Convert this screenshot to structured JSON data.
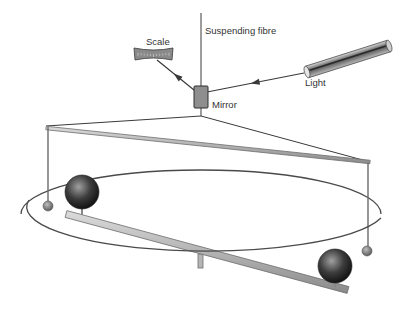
{
  "labels": {
    "suspending_fibre": "Suspending fibre",
    "scale": "Scale",
    "mirror": "Mirror",
    "light": "Light"
  },
  "label_positions": {
    "suspending_fibre": {
      "x": 205,
      "y": 26
    },
    "scale": {
      "x": 146,
      "y": 37
    },
    "mirror": {
      "x": 212,
      "y": 100
    },
    "light": {
      "x": 305,
      "y": 78
    }
  },
  "colors": {
    "line": "#3a3a3a",
    "rod_fill": "#b8b8b8",
    "rod_edge": "#6e6e6e",
    "sphere_dark": "#1e1e1e",
    "sphere_light": "#9a9a9a",
    "mirror_fill": "#8e8e8e",
    "scale_fill": "#8a8a8a",
    "ellipse": "#4a4a4a"
  },
  "geometry": {
    "fibre": {
      "x": 201,
      "y1": 13,
      "y2": 116
    },
    "mirror": {
      "x": 194,
      "y": 86,
      "w": 14,
      "h": 22
    },
    "scale": {
      "x": 134,
      "y": 48,
      "w": 39,
      "h": 12
    },
    "light_tube": {
      "x1": 307,
      "y1": 72,
      "x2": 389,
      "y2": 46,
      "r": 6
    },
    "incident_ray": {
      "x1": 207,
      "y1": 92,
      "x2": 304,
      "y2": 73
    },
    "reflected_ray": {
      "x1": 194,
      "y1": 90,
      "x2": 157,
      "y2": 60
    },
    "cross_bar": {
      "x1": 46,
      "y1": 126,
      "x2": 370,
      "y2": 162
    },
    "hanger_left": {
      "x1": 201,
      "y1": 116,
      "x2": 46,
      "y2": 126
    },
    "hanger_right": {
      "x1": 201,
      "y1": 116,
      "x2": 370,
      "y2": 162
    },
    "pendant_left": {
      "x": 48,
      "y1": 127,
      "y2": 201,
      "ball_cy": 206,
      "ball_r": 5
    },
    "pendant_right": {
      "x": 368,
      "y1": 163,
      "y2": 246,
      "ball_cy": 251,
      "ball_r": 5
    },
    "ellipse": {
      "cx": 201,
      "cy": 214,
      "rx": 180,
      "ry": 44
    },
    "floor_bar": {
      "x1": 66,
      "y1": 214,
      "x2": 348,
      "y2": 290,
      "w": 7
    },
    "floor_support": {
      "x": 198,
      "y1": 254,
      "y2": 268
    },
    "sphere_left": {
      "cx": 82,
      "cy": 192,
      "r": 17
    },
    "sphere_right": {
      "cx": 335,
      "cy": 266,
      "r": 17
    }
  }
}
